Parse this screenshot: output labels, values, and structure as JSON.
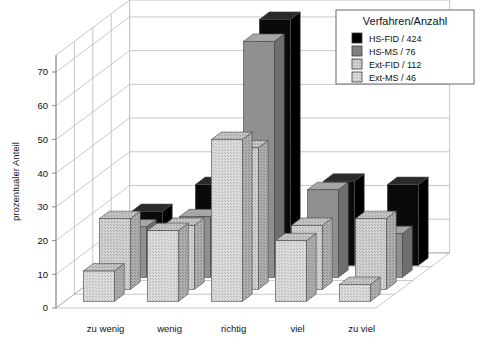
{
  "chart_data": {
    "type": "bar",
    "title": "",
    "xlabel": "",
    "ylabel": "prozentualer Anteil",
    "ylim": [
      0,
      75
    ],
    "yticks": [
      0,
      10,
      20,
      30,
      40,
      50,
      60,
      70
    ],
    "grid": true,
    "projection": "3d",
    "legend_title": "Verfahren/Anzahl",
    "legend_position": "top-right",
    "categories": [
      "zu wenig",
      "wenig",
      "richtig",
      "viel",
      "zu viel"
    ],
    "series": [
      {
        "name": "HS-FID / 424",
        "label": "HS-FID / 424",
        "color": "#000000",
        "fill": "solid",
        "values": [
          16,
          24,
          73,
          25,
          24
        ]
      },
      {
        "name": "HS-MS / 76",
        "label": "HS-MS / 76",
        "color": "#808080",
        "fill": "solid",
        "values": [
          15,
          18,
          70,
          26,
          13
        ]
      },
      {
        "name": "Ext-FID / 112",
        "label": "Ext-FID / 112",
        "color": "#c8c8c8",
        "fill": "hatch",
        "values": [
          21,
          19,
          42,
          19,
          21
        ]
      },
      {
        "name": "Ext-MS / 46",
        "label": "Ext-MS / 46",
        "color": "#d6d6d6",
        "fill": "hatch2",
        "values": [
          9,
          21,
          48,
          18,
          5
        ]
      }
    ]
  },
  "axis": {
    "y_title": "prozentualer Anteil",
    "tick_labels": [
      "0",
      "10",
      "20",
      "30",
      "40",
      "50",
      "60",
      "70"
    ],
    "category_labels": [
      "zu wenig",
      "wenig",
      "richtig",
      "viel",
      "zu viel"
    ]
  },
  "legend": {
    "title": "Verfahren/Anzahl",
    "entries": [
      {
        "label": "HS-FID / 424",
        "swatch": "#000000"
      },
      {
        "label": "HS-MS / 76",
        "swatch": "#808080"
      },
      {
        "label": "Ext-FID / 112",
        "swatch": "#c8c8c8"
      },
      {
        "label": "Ext-MS / 46",
        "swatch": "#d8d8d8"
      }
    ]
  },
  "colors": {
    "background": "#ffffff",
    "grid": "#b0b0b0",
    "axis": "#888888",
    "text": "#111111"
  }
}
